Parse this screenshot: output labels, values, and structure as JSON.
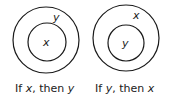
{
  "diagrams": [
    {
      "outer_label": "y",
      "inner_label": "x",
      "caption_prefix": "If ",
      "caption_a": "x",
      "caption_mid": ", then ",
      "caption_b": "y"
    },
    {
      "outer_label": "x",
      "inner_label": "y",
      "caption_prefix": "If ",
      "caption_a": "y",
      "caption_mid": ", then ",
      "caption_b": "x"
    }
  ]
}
